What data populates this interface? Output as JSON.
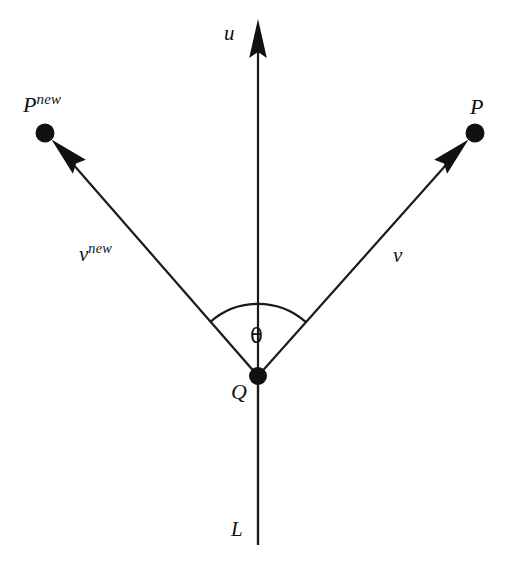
{
  "figure": {
    "type": "geometry-diagram",
    "width": 514,
    "height": 570,
    "background_color": "#ffffff",
    "stroke_color": "#1a1a1a",
    "labels": {
      "u": "u",
      "P_new_base": "P",
      "P_new_sup": "new",
      "P": "P",
      "v_new_base": "ν",
      "v_new_sup": "new",
      "v": "ν",
      "theta": "θ",
      "Q": "Q",
      "L": "L"
    },
    "points": {
      "Q": {
        "x": 258,
        "y": 376,
        "radius": 9,
        "label": "Q"
      },
      "P": {
        "x": 475,
        "y": 133,
        "radius": 9.5,
        "label": "P"
      },
      "P_new": {
        "x": 45,
        "y": 133,
        "radius": 9.5,
        "label": "P new"
      }
    },
    "vectors": [
      {
        "name": "u",
        "from": "Q",
        "to_x": 258,
        "to_y": 20,
        "label": "u",
        "arrow": true
      },
      {
        "name": "v",
        "from": "Q",
        "to_x": 468,
        "to_y": 141,
        "label": "ν",
        "arrow": true
      },
      {
        "name": "v_new",
        "from": "Q",
        "to_x": 52,
        "to_y": 141,
        "label": "ν new",
        "arrow": true
      }
    ],
    "line_L": {
      "from_x": 258,
      "from_y": 376,
      "to_x": 258,
      "to_y": 545,
      "label": "L",
      "arrow": false
    },
    "angle_arc": {
      "center_x": 258,
      "center_y": 376,
      "radius": 72,
      "from_deg": 228,
      "to_deg": 312,
      "label": "θ"
    }
  }
}
